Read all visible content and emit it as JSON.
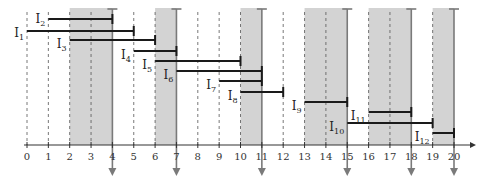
{
  "diagram": {
    "type": "interval-scheduling-timeline",
    "axis": {
      "min": 0,
      "max": 20,
      "ticks": [
        0,
        1,
        2,
        3,
        4,
        5,
        6,
        7,
        8,
        9,
        10,
        11,
        12,
        13,
        14,
        15,
        16,
        17,
        18,
        19,
        20
      ],
      "tick_labels": [
        "0",
        "1",
        "2",
        "3",
        "4",
        "5",
        "6",
        "7",
        "8",
        "9",
        "10",
        "11",
        "12",
        "13",
        "14",
        "15",
        "16",
        "17",
        "18",
        "19",
        "20"
      ]
    },
    "shaded_regions": [
      {
        "start": 2,
        "end": 4
      },
      {
        "start": 6,
        "end": 7
      },
      {
        "start": 10,
        "end": 11
      },
      {
        "start": 13,
        "end": 15
      },
      {
        "start": 16,
        "end": 18
      },
      {
        "start": 19,
        "end": 20
      }
    ],
    "selected_points": [
      4,
      7,
      11,
      15,
      18,
      20
    ],
    "intervals": [
      {
        "label": "I",
        "sub": "1",
        "start": 0,
        "end": 5,
        "row": 2
      },
      {
        "label": "I",
        "sub": "2",
        "start": 1,
        "end": 4,
        "row": 1
      },
      {
        "label": "I",
        "sub": "3",
        "start": 2,
        "end": 6,
        "row": 3
      },
      {
        "label": "I",
        "sub": "4",
        "start": 5,
        "end": 7,
        "row": 4
      },
      {
        "label": "I",
        "sub": "5",
        "start": 6,
        "end": 10,
        "row": 5
      },
      {
        "label": "I",
        "sub": "6",
        "start": 7,
        "end": 11,
        "row": 6
      },
      {
        "label": "I",
        "sub": "7",
        "start": 9,
        "end": 11,
        "row": 7
      },
      {
        "label": "I",
        "sub": "8",
        "start": 10,
        "end": 12,
        "row": 8
      },
      {
        "label": "I",
        "sub": "9",
        "start": 13,
        "end": 15,
        "row": 9
      },
      {
        "label": "I",
        "sub": "10",
        "start": 15,
        "end": 19,
        "row": 11
      },
      {
        "label": "I",
        "sub": "11",
        "start": 16,
        "end": 18,
        "row": 10
      },
      {
        "label": "I",
        "sub": "12",
        "start": 19,
        "end": 20,
        "row": 12
      }
    ],
    "colors": {
      "shade": "#d3d3d3",
      "interval": "#1a1a1a",
      "marker": "#7a7a7a",
      "axis": "#333333",
      "dashed": "#555555"
    }
  }
}
